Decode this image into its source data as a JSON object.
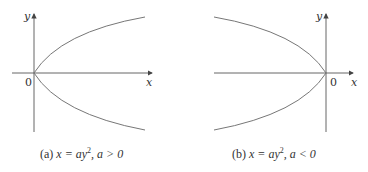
{
  "panels": [
    {
      "id": "a",
      "axis_labels": {
        "x": "x",
        "y": "y",
        "origin": "0"
      },
      "caption": {
        "prefix": "(a)",
        "equation": "x = ay",
        "exponent": "2",
        "condition": ", a > 0"
      }
    },
    {
      "id": "b",
      "axis_labels": {
        "x": "x",
        "y": "y",
        "origin": "0"
      },
      "caption": {
        "prefix": "(b)",
        "equation": "x = ay",
        "exponent": "2",
        "condition": ", a < 0"
      }
    }
  ],
  "colors": {
    "axis": "#555555",
    "curve": "#777777",
    "text": "#333333"
  }
}
